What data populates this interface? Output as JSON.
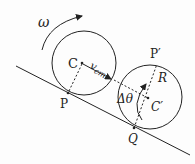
{
  "diagram": {
    "type": "rolling-wheel-on-incline",
    "labels": {
      "omega": "ω",
      "center_initial": "C",
      "velocity": "v",
      "velocity_sub": "cm",
      "contact_initial": "P",
      "contact_final": "Q",
      "center_final": "C′",
      "point_top_final": "P′",
      "radius_label": "R",
      "angle_label": "Δθ"
    },
    "colors": {
      "stroke": "#222222",
      "background": "#fdfdfd"
    }
  }
}
